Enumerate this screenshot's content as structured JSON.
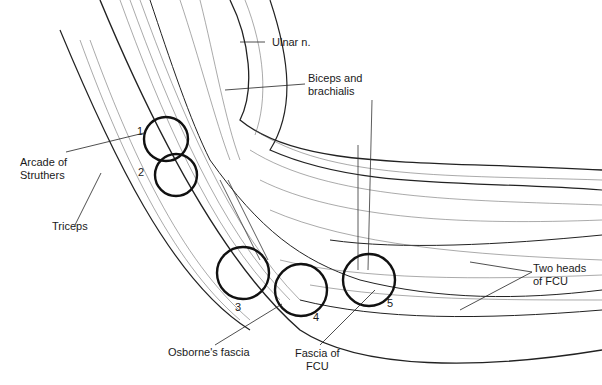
{
  "figure": {
    "type": "anatomical illustration"
  },
  "labels": {
    "ulnar_n": "Ulnar n.",
    "biceps": [
      "Biceps and",
      "brachialis"
    ],
    "arcade": [
      "Arcade of",
      "Struthers"
    ],
    "triceps": "Triceps",
    "osborne": "Osborne's fascia",
    "fascia_fcu": [
      "Fascia of",
      "FCU"
    ],
    "two_heads": [
      "Two heads",
      "of FCU"
    ]
  },
  "sites": [
    {
      "number": "1"
    },
    {
      "number": "2"
    },
    {
      "number": "3"
    },
    {
      "number": "4"
    },
    {
      "number": "5"
    }
  ],
  "colors": {
    "ink": "#111111",
    "background": "#ffffff"
  }
}
